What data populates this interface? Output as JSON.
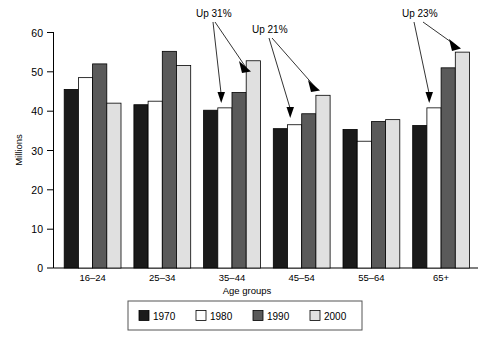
{
  "chart_data": {
    "type": "bar",
    "title": "",
    "subtitle": "",
    "xlabel": "Age groups",
    "ylabel": "Millions",
    "categories": [
      "16–24",
      "25–34",
      "35–44",
      "45–54",
      "55–64",
      "65+"
    ],
    "series": [
      {
        "name": "1970",
        "color": "#1a1a1a",
        "values": [
          45.5,
          41.6,
          40.2,
          35.5,
          35.3,
          36.3
        ]
      },
      {
        "name": "1980",
        "color": "#ffffff",
        "values": [
          48.5,
          42.5,
          40.8,
          36.5,
          32.3,
          40.8
        ]
      },
      {
        "name": "1990",
        "color": "#5a5a5a",
        "values": [
          52.0,
          55.2,
          44.7,
          39.3,
          37.3,
          51.0
        ]
      },
      {
        "name": "2000",
        "color": "#e0e0e0",
        "values": [
          42.0,
          51.6,
          52.8,
          44.0,
          37.8,
          55.0
        ]
      }
    ],
    "ylim": [
      0,
      60
    ],
    "yticks": [
      0,
      10,
      20,
      30,
      40,
      50,
      60
    ],
    "ytick_labels": [
      "0",
      "10",
      "20",
      "30",
      "40",
      "50",
      "60"
    ],
    "grid": false,
    "legend_position": "bottom",
    "annotations": [
      {
        "text": "Up 31%",
        "from_group": "35–44",
        "from_series": "1980",
        "to_series": "2000",
        "value": "31%"
      },
      {
        "text": "Up 21%",
        "from_group": "45–54",
        "from_series": "1980",
        "to_series": "2000",
        "value": "21%"
      },
      {
        "text": "Up 23%",
        "from_group": "65+",
        "from_series": "1980",
        "to_series": "2000",
        "value": "23%"
      }
    ]
  },
  "axis": {
    "y_label": "Millions",
    "x_label": "Age groups",
    "y_ticks": [
      "60",
      "50",
      "40",
      "30",
      "20",
      "10",
      "0"
    ],
    "x_ticks": [
      "16–24",
      "25–34",
      "35–44",
      "45–54",
      "55–64",
      "65+"
    ]
  },
  "legend": {
    "items": [
      {
        "label": "1970",
        "swatch": "#1a1a1a"
      },
      {
        "label": "1980",
        "swatch": "#ffffff"
      },
      {
        "label": "1990",
        "swatch": "#5a5a5a"
      },
      {
        "label": "2000",
        "swatch": "#e0e0e0"
      }
    ]
  },
  "annotations": {
    "a1": "Up 31%",
    "a2": "Up 21%",
    "a3": "Up 23%"
  }
}
